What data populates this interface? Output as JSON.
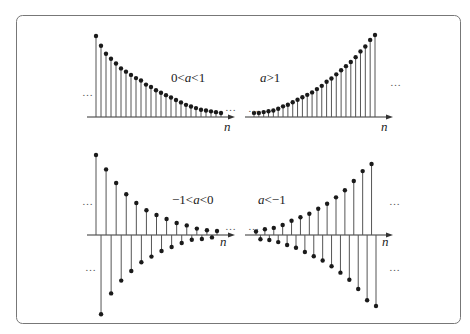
{
  "chart_data": {
    "type": "stem",
    "title": "",
    "panels": [
      {
        "id": "top-left",
        "label_pre": "0<",
        "label_var": "a",
        "label_post": "<1",
        "xlabel": "n",
        "ellipsis_left": "…",
        "ellipsis_right": "…",
        "description": "decaying exponential sequence, all positive",
        "values": [
          1.0,
          0.88,
          0.78,
          0.72,
          0.66,
          0.6,
          0.56,
          0.52,
          0.48,
          0.45,
          0.4,
          0.37,
          0.33,
          0.3,
          0.27,
          0.24,
          0.21,
          0.18,
          0.15,
          0.13,
          0.11,
          0.09,
          0.08,
          0.07,
          0.06,
          0.05
        ]
      },
      {
        "id": "top-right",
        "label_pre": "",
        "label_var": "a",
        "label_post": ">1",
        "xlabel": "n",
        "ellipsis_left": "…",
        "ellipsis_right": "…",
        "description": "growing exponential sequence, all positive",
        "values": [
          0.05,
          0.05,
          0.06,
          0.07,
          0.08,
          0.1,
          0.13,
          0.15,
          0.18,
          0.21,
          0.24,
          0.27,
          0.3,
          0.34,
          0.38,
          0.43,
          0.47,
          0.52,
          0.57,
          0.62,
          0.67,
          0.73,
          0.8,
          0.86,
          0.94,
          1.0
        ]
      },
      {
        "id": "bottom-left",
        "label_pre": "−1<",
        "label_var": "a",
        "label_post": "<0",
        "xlabel": "n",
        "ellipsis_left": "…",
        "ellipsis_right": "…",
        "ellipsis_lower": "…",
        "description": "alternating-sign decaying sequence",
        "values": [
          1.0,
          -0.99,
          0.82,
          -0.73,
          0.65,
          -0.57,
          0.51,
          -0.45,
          0.4,
          -0.34,
          0.31,
          -0.27,
          0.25,
          -0.2,
          0.2,
          -0.15,
          0.15,
          -0.1,
          0.12,
          -0.06,
          0.08,
          -0.05,
          0.06,
          -0.03,
          0.05
        ]
      },
      {
        "id": "bottom-right",
        "label_pre": "",
        "label_var": "a",
        "label_post": "<−1",
        "xlabel": "n",
        "ellipsis_left": "…",
        "ellipsis_right": "…",
        "ellipsis_lower": "…",
        "description": "alternating-sign growing sequence",
        "values": [
          0.05,
          -0.06,
          0.08,
          -0.07,
          0.1,
          -0.1,
          0.14,
          -0.14,
          0.2,
          -0.18,
          0.25,
          -0.24,
          0.3,
          -0.3,
          0.37,
          -0.36,
          0.44,
          -0.44,
          0.53,
          -0.53,
          0.63,
          -0.63,
          0.76,
          -0.76,
          0.9,
          -0.92,
          1.0,
          -1.0
        ]
      }
    ]
  },
  "colors": {
    "stem": "#555555",
    "dot": "#1a1a1a",
    "axis": "#333333",
    "frame": "#777777"
  }
}
